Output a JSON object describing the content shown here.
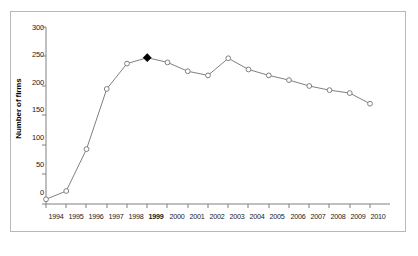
{
  "chart_data": {
    "type": "line",
    "title": "",
    "xlabel": "",
    "ylabel": "Number of firms",
    "ylim": [
      0,
      300
    ],
    "yticks": [
      0,
      50,
      100,
      150,
      200,
      250,
      300
    ],
    "grid": false,
    "legend": "none",
    "categories": [
      "1994",
      "1995",
      "1996",
      "1997",
      "1998",
      "1999",
      "2000",
      "2001",
      "2002",
      "2003",
      "2004",
      "2005",
      "2006",
      "2007",
      "2008",
      "2009",
      "2010"
    ],
    "values": [
      8,
      22,
      93,
      195,
      238,
      248,
      240,
      225,
      218,
      247,
      228,
      218,
      210,
      200,
      193,
      188,
      170
    ],
    "highlight_category": "1999",
    "marker_style": "open-circle",
    "highlight_marker_style": "filled-diamond",
    "line_color": "#808080",
    "marker_color": "#808080",
    "highlight_color": "#000000"
  },
  "axis": {
    "y_tick_labels": [
      "300",
      "250",
      "200",
      "150",
      "100",
      "50",
      "0"
    ],
    "x_tick_labels": [
      "1994",
      "1995",
      "1996",
      "1997",
      "1998",
      "1999",
      "2000",
      "2001",
      "2002",
      "2003",
      "2004",
      "2005",
      "2006",
      "2007",
      "2008",
      "2009",
      "2010"
    ]
  },
  "colors": {
    "frame": "#b8b8b8",
    "axis": "#808080",
    "text": "#1a1a1a",
    "series": "#808080",
    "highlight": "#000000"
  }
}
